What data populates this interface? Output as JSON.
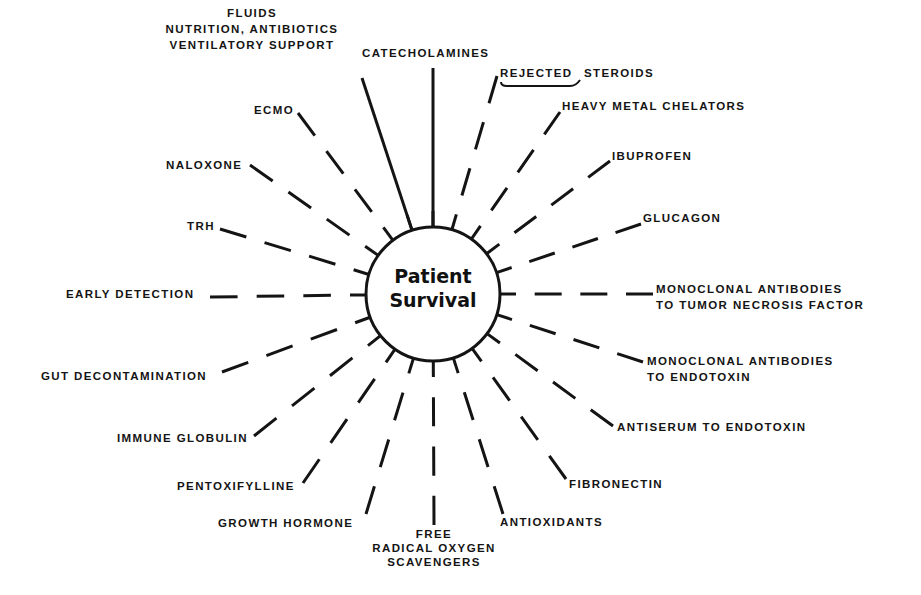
{
  "diagram": {
    "center": {
      "line1": "Patient",
      "line2": "Survival"
    },
    "colors": {
      "ink": "#141414",
      "background": "#ffffff"
    },
    "labels": {
      "fluids": "FLUIDS",
      "nutrition": "NUTRITION, ANTIBIOTICS",
      "ventilatory": "VENTILATORY SUPPORT",
      "catecholamines": "CATECHOLAMINES",
      "rejected": "REJECTED",
      "steroids": "STEROIDS",
      "heavy_metal": "HEAVY METAL CHELATORS",
      "ibuprofen": "IBUPROFEN",
      "glucagon": "GLUCAGON",
      "mab_tnf_1": "MONOCLONAL ANTIBODIES",
      "mab_tnf_2": "TO TUMOR NECROSIS FACTOR",
      "mab_endo_1": "MONOCLONAL ANTIBODIES",
      "mab_endo_2": "TO ENDOTOXIN",
      "antiserum": "ANTISERUM TO ENDOTOXIN",
      "fibronectin": "FIBRONECTIN",
      "antioxidants": "ANTIOXIDANTS",
      "free_1": "FREE",
      "free_2": "RADICAL OXYGEN",
      "free_3": "SCAVENGERS",
      "growth_hormone": "GROWTH HORMONE",
      "pentoxifylline": "PENTOXIFYLLINE",
      "immune_globulin": "IMMUNE GLOBULIN",
      "gut_decontamination": "GUT DECONTAMINATION",
      "early_detection": "EARLY DETECTION",
      "trh": "TRH",
      "naloxone": "NALOXONE",
      "ecmo": "ECMO"
    },
    "rays": [
      {
        "name": "ventilatory-support",
        "style": "solid",
        "x2": 362,
        "y2": 78
      },
      {
        "name": "catecholamines",
        "style": "solid",
        "x2": 433,
        "y2": 68
      },
      {
        "name": "steroids",
        "style": "dashed",
        "x2": 497,
        "y2": 76
      },
      {
        "name": "heavy-metal-chelators",
        "style": "dashed",
        "x2": 560,
        "y2": 112
      },
      {
        "name": "ibuprofen",
        "style": "dashed",
        "x2": 610,
        "y2": 161
      },
      {
        "name": "glucagon",
        "style": "dashed",
        "x2": 641,
        "y2": 224
      },
      {
        "name": "mab-tnf",
        "style": "dashed",
        "x2": 653,
        "y2": 294
      },
      {
        "name": "mab-endotoxin",
        "style": "dashed",
        "x2": 643,
        "y2": 362
      },
      {
        "name": "antiserum-endotoxin",
        "style": "dashed",
        "x2": 613,
        "y2": 426
      },
      {
        "name": "fibronectin",
        "style": "dashed",
        "x2": 566,
        "y2": 479
      },
      {
        "name": "antioxidants",
        "style": "dashed",
        "x2": 503,
        "y2": 514
      },
      {
        "name": "free-radical-scavengers",
        "style": "dashed",
        "x2": 434,
        "y2": 525
      },
      {
        "name": "growth-hormone",
        "style": "dashed",
        "x2": 366,
        "y2": 514
      },
      {
        "name": "pentoxifylline",
        "style": "dashed",
        "x2": 303,
        "y2": 483
      },
      {
        "name": "immune-globulin",
        "style": "dashed",
        "x2": 254,
        "y2": 436
      },
      {
        "name": "gut-decontamination",
        "style": "dashed",
        "x2": 222,
        "y2": 372
      },
      {
        "name": "early-detection",
        "style": "dashed",
        "x2": 210,
        "y2": 297
      },
      {
        "name": "trh",
        "style": "dashed",
        "x2": 220,
        "y2": 229
      },
      {
        "name": "naloxone",
        "style": "dashed",
        "x2": 250,
        "y2": 165
      },
      {
        "name": "ecmo",
        "style": "dashed",
        "x2": 298,
        "y2": 113
      }
    ]
  }
}
